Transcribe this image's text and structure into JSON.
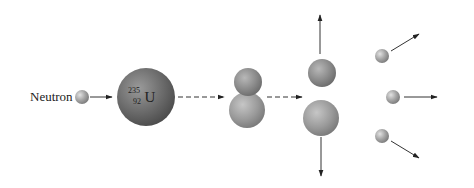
{
  "diagram": {
    "incoming_label": "Neutron",
    "nucleus": {
      "mass_number": "235",
      "atomic_number": "92",
      "symbol": "U"
    },
    "stages": [
      "neutron-approaches",
      "uranium-235-nucleus",
      "excited-compound-nucleus",
      "fission-fragments",
      "released-neutrons"
    ],
    "released_neutron_count": 3,
    "colors": {
      "neutron": "#a8a8a8",
      "uranium": "#6e6e6e",
      "fragment": "#8c8c8c",
      "arrow": "#222222"
    }
  }
}
